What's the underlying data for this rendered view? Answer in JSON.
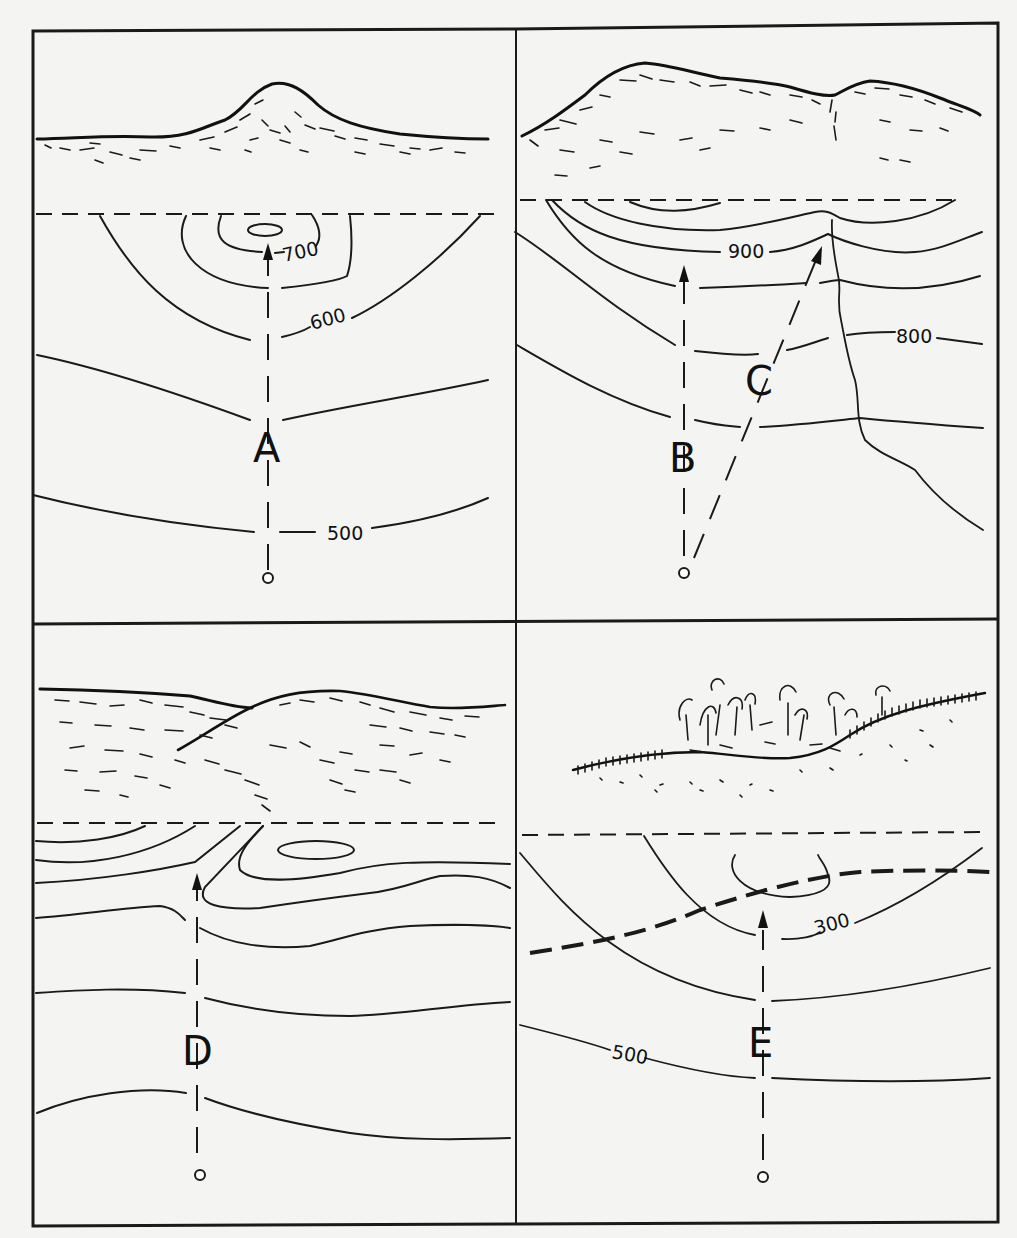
{
  "figure": {
    "panels": [
      {
        "id": "top-left",
        "route_label": "A",
        "contour_labels": [
          "700",
          "600",
          "500"
        ],
        "landscape": "single rounded hill"
      },
      {
        "id": "top-right",
        "route_labels": [
          "B",
          "C"
        ],
        "contour_labels": [
          "900",
          "800"
        ],
        "landscape": "ridge with two summits and a ravine"
      },
      {
        "id": "bottom-left",
        "route_label": "D",
        "contour_labels": [],
        "landscape": "two overlapping hills"
      },
      {
        "id": "bottom-right",
        "route_label": "E",
        "contour_labels": [
          "300",
          "500"
        ],
        "landscape": "wooded depression crossed by a railroad"
      }
    ]
  },
  "labels": {
    "A": "A",
    "B": "B",
    "C": "C",
    "D": "D",
    "E": "E",
    "c700": "700",
    "c600": "600",
    "c500a": "500",
    "c900": "900",
    "c800": "800",
    "c300": "300",
    "c500e": "500"
  }
}
